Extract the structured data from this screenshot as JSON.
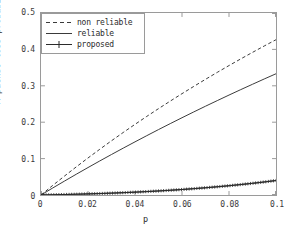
{
  "chart_data": {
    "type": "line",
    "title": "",
    "xlabel": "p",
    "ylabel": "A packet loss probability",
    "xlim": [
      0,
      0.1
    ],
    "ylim": [
      0,
      0.5
    ],
    "xticks": [
      "0",
      "0.02",
      "0.04",
      "0.06",
      "0.08",
      "0.1"
    ],
    "xtick_values": [
      0,
      0.02,
      0.04,
      0.06,
      0.08,
      0.1
    ],
    "yticks": [
      "0",
      "0.1",
      "0.2",
      "0.3",
      "0.4",
      "0.5"
    ],
    "ytick_values": [
      0,
      0.1,
      0.2,
      0.3,
      0.4,
      0.5
    ],
    "grid": false,
    "legend_position": "upper left",
    "x": [
      0,
      0.005,
      0.01,
      0.015,
      0.02,
      0.025,
      0.03,
      0.035,
      0.04,
      0.045,
      0.05,
      0.055,
      0.06,
      0.065,
      0.07,
      0.075,
      0.08,
      0.085,
      0.09,
      0.095,
      0.1
    ],
    "series": [
      {
        "name": "non reliable",
        "style": "dashed",
        "marker": "none",
        "color": "#3a3a3a",
        "values": [
          0,
          0.0264,
          0.0521,
          0.0772,
          0.1017,
          0.1256,
          0.149,
          0.1718,
          0.1941,
          0.2159,
          0.2372,
          0.258,
          0.2784,
          0.2983,
          0.3178,
          0.3369,
          0.3556,
          0.3739,
          0.3918,
          0.4094,
          0.4266
        ]
      },
      {
        "name": "reliable",
        "style": "solid",
        "marker": "none",
        "color": "#3a3a3a",
        "values": [
          0,
          0.0193,
          0.0383,
          0.057,
          0.0754,
          0.0935,
          0.1113,
          0.1288,
          0.146,
          0.163,
          0.1797,
          0.1961,
          0.2123,
          0.2282,
          0.2439,
          0.2593,
          0.2745,
          0.2895,
          0.3042,
          0.3188,
          0.3331
        ]
      },
      {
        "name": "proposed",
        "style": "solid",
        "marker": "plus",
        "color": "#2b2b2b",
        "values": [
          0,
          0.0006,
          0.0013,
          0.0021,
          0.003,
          0.004,
          0.0051,
          0.0064,
          0.0078,
          0.0094,
          0.0111,
          0.013,
          0.0151,
          0.0174,
          0.0199,
          0.0226,
          0.0255,
          0.0287,
          0.0321,
          0.0358,
          0.0398
        ]
      }
    ]
  },
  "legend": {
    "items": [
      {
        "label": "non reliable"
      },
      {
        "label": "reliable"
      },
      {
        "label": "proposed"
      }
    ]
  },
  "axes": {
    "x_title": "p",
    "y_title": "A packet loss probability"
  },
  "colors": {
    "frame": "#9a9a9a",
    "text": "#2b2b2b",
    "line": "#3a3a3a",
    "background": "#ffffff"
  }
}
